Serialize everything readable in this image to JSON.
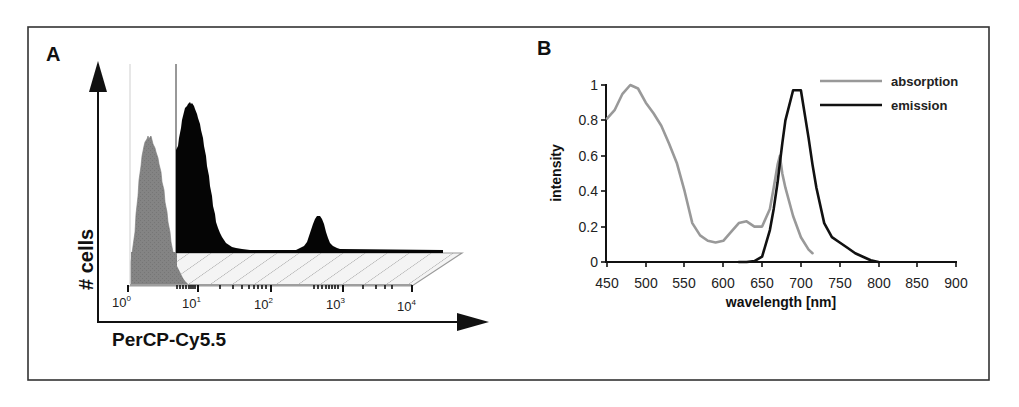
{
  "figure": {
    "frame": {
      "x": 28,
      "y": 27,
      "width": 961,
      "height": 353,
      "color": "#333333"
    }
  },
  "chart_data": [
    {
      "panel": "A",
      "type": "area",
      "title": "",
      "xlabel": "PerCP-Cy5.5",
      "ylabel": "# cells",
      "x_scale": "log",
      "x_tick_labels": [
        {
          "base": "10",
          "exp": "0"
        },
        {
          "base": "10",
          "exp": "1"
        },
        {
          "base": "10",
          "exp": "2"
        },
        {
          "base": "10",
          "exp": "3"
        },
        {
          "base": "10",
          "exp": "4"
        }
      ],
      "xlim": [
        1,
        10000
      ],
      "grid": false,
      "legend": null,
      "series": [
        {
          "name": "unstained control (back trace)",
          "color": "#808080",
          "description": "single peak near 10^0.3",
          "peak_x": 2,
          "relative_height": 0.74
        },
        {
          "name": "stained sample (front trace)",
          "color": "#000000",
          "description": "major peak near 10^1, minor peak near 10^2.7",
          "peaks": [
            {
              "x": 8,
              "relative_height": 1.0
            },
            {
              "x": 500,
              "relative_height": 0.23
            }
          ]
        }
      ]
    },
    {
      "panel": "B",
      "type": "line",
      "title": "",
      "xlabel": "wavelength [nm]",
      "ylabel": "intensity",
      "x": [
        450,
        460,
        470,
        480,
        490,
        500,
        510,
        520,
        530,
        540,
        550,
        560,
        570,
        580,
        590,
        600,
        610,
        620,
        630,
        640,
        650,
        660,
        665,
        670,
        673,
        676,
        680,
        690,
        700,
        710,
        715,
        720,
        730,
        740,
        750,
        760,
        770,
        780,
        790,
        800
      ],
      "series": [
        {
          "name": "absorption",
          "color": "#999999",
          "values": [
            0.81,
            0.86,
            0.95,
            1.0,
            0.98,
            0.9,
            0.84,
            0.77,
            0.67,
            0.56,
            0.4,
            0.22,
            0.15,
            0.12,
            0.11,
            0.12,
            0.17,
            0.22,
            0.23,
            0.2,
            0.2,
            0.3,
            0.42,
            0.55,
            0.6,
            0.5,
            0.42,
            0.26,
            0.14,
            0.07,
            0.05,
            null,
            null,
            null,
            null,
            null,
            null,
            null,
            null,
            null
          ]
        },
        {
          "name": "emission",
          "color": "#111111",
          "values": [
            null,
            null,
            null,
            null,
            null,
            null,
            null,
            null,
            null,
            null,
            null,
            null,
            null,
            null,
            null,
            null,
            null,
            0.0,
            0.0,
            0.005,
            0.03,
            0.18,
            0.3,
            0.45,
            0.56,
            0.67,
            0.8,
            0.97,
            0.97,
            0.7,
            0.55,
            0.42,
            0.22,
            0.14,
            0.11,
            0.08,
            0.05,
            0.03,
            0.01,
            0.0
          ]
        }
      ],
      "x_ticks": [
        450,
        500,
        550,
        600,
        650,
        700,
        750,
        800,
        850,
        900
      ],
      "y_ticks": [
        0,
        0.2,
        0.4,
        0.6,
        0.8,
        1
      ],
      "y_tick_labels": [
        "0",
        "0.2",
        "0.4",
        "0.6",
        "0.8",
        "1"
      ],
      "xlim": [
        450,
        900
      ],
      "ylim": [
        0,
        1
      ],
      "grid": false,
      "legend_position": "upper right"
    }
  ],
  "panels": {
    "a": {
      "letter": "A",
      "ylabel": "# cells",
      "xlabel": "PerCP-Cy5.5"
    },
    "b": {
      "letter": "B",
      "ylabel": "intensity",
      "xlabel": "wavelength [nm]",
      "legend": [
        {
          "label": "absorption",
          "color": "#999999"
        },
        {
          "label": "emission",
          "color": "#111111"
        }
      ]
    }
  }
}
